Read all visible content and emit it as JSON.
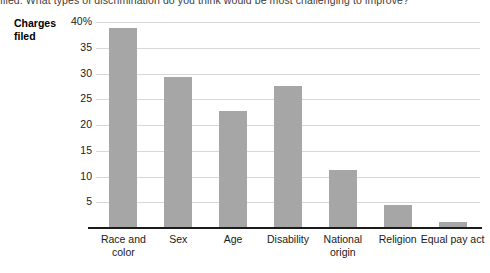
{
  "caption": {
    "text": "filed. What types of discrimination do you think would be most challenging to improve?"
  },
  "chart_data": {
    "type": "bar",
    "title": "",
    "subtitle": "",
    "xlabel": "",
    "ylabel": "Charges filed",
    "categories": [
      "Race and color",
      "Sex",
      "Age",
      "Disability",
      "National origin",
      "Religion",
      "Equal pay act"
    ],
    "values": [
      38.8,
      29.4,
      22.8,
      27.6,
      11.3,
      4.4,
      1.2
    ],
    "ylim": [
      0,
      40
    ],
    "yticks": [
      5,
      10,
      15,
      20,
      25,
      30,
      35,
      40
    ],
    "ytick_labels": [
      "5",
      "10",
      "15",
      "20",
      "25",
      "30",
      "35",
      "40%"
    ],
    "grid": true,
    "legend": false,
    "bar_color": "#a6a6a6",
    "gridline_color": "#d8d8d8",
    "axis_color": "#1b1b1b"
  }
}
